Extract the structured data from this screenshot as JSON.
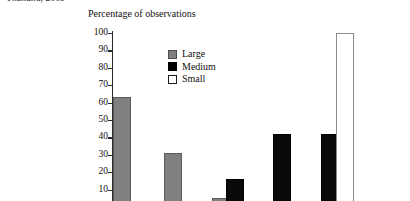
{
  "clipped_header": "Thailand, 2003",
  "chart_data": {
    "type": "bar",
    "title": "",
    "ylabel": "Percentage of observations",
    "xlabel": "",
    "ylim": [
      0,
      100
    ],
    "yticks": [
      100,
      90,
      80,
      70,
      60,
      50,
      40,
      30,
      20,
      10
    ],
    "grid": false,
    "legend_position": "upper-center-left",
    "categories": [
      "Group 1",
      "Group 2",
      "Group 3",
      "Group 4",
      "Group 5"
    ],
    "series": [
      {
        "name": "Large",
        "color": "#808080",
        "values": [
          63,
          31,
          5,
          0,
          0
        ]
      },
      {
        "name": "Medium",
        "color": "#000000",
        "values": [
          0,
          0,
          16,
          42,
          42
        ]
      },
      {
        "name": "Small",
        "color": "#ffffff",
        "values": [
          0,
          0,
          0,
          0,
          100
        ]
      }
    ],
    "bars": [
      {
        "series": "Large",
        "value": 63,
        "left": 113,
        "width": 16
      },
      {
        "series": "Large",
        "value": 31,
        "left": 164,
        "width": 16
      },
      {
        "series": "Large",
        "value": 5,
        "left": 212,
        "width": 16
      },
      {
        "series": "Medium",
        "value": 16,
        "left": 226,
        "width": 16
      },
      {
        "series": "Medium",
        "value": 42,
        "left": 273,
        "width": 16
      },
      {
        "series": "Medium",
        "value": 42,
        "left": 321,
        "width": 16
      },
      {
        "series": "Small",
        "value": 100,
        "left": 336,
        "width": 16
      }
    ]
  },
  "legend": {
    "items": [
      {
        "label": "Large",
        "swatch": "large-swatch"
      },
      {
        "label": "Medium",
        "swatch": "medium-swatch"
      },
      {
        "label": "Small",
        "swatch": "small-swatch"
      }
    ]
  }
}
